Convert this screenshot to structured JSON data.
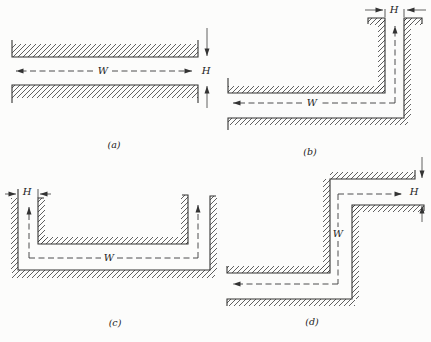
{
  "figure": {
    "ink_color": "#333333",
    "paper_color": "#fcfcfb",
    "panels": [
      {
        "caption": "(a)",
        "width_label": "W",
        "height_label": "H"
      },
      {
        "caption": "(b)",
        "width_label": "W",
        "height_label": "H"
      },
      {
        "caption": "(c)",
        "width_label": "W",
        "height_label": "H"
      },
      {
        "caption": "(d)",
        "width_label": "W",
        "height_label": "H"
      }
    ]
  }
}
